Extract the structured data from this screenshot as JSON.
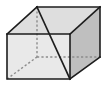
{
  "figure": {
    "shape_name": "cuboid",
    "width_px": 108,
    "height_px": 92,
    "background_color": "#ffffff"
  },
  "colors": {
    "front_face": "#e9e9e9",
    "top_face": "#dedede",
    "right_face": "#bfbfbf",
    "edge_stroke": "#1d1d1d",
    "hidden_stroke": "#8c8c8c",
    "diagonal_stroke": "#1d1d1d",
    "background": "#ffffff"
  },
  "strokes": {
    "edge_width": 1.6,
    "hidden_width": 1.4,
    "diagonal_width": 1.7,
    "hidden_dash": "2.2 2.2"
  },
  "vertices": {
    "front_top_left": [
      7,
      34
    ],
    "front_top_right": [
      70,
      34
    ],
    "front_bottom_right": [
      70,
      79
    ],
    "front_bottom_left": [
      7,
      79
    ],
    "back_top_left": [
      37,
      7
    ],
    "back_top_right": [
      100,
      7
    ],
    "back_bottom_right": [
      100,
      57
    ],
    "back_bottom_left": [
      37,
      57
    ]
  },
  "faces": {
    "front": "7,34 70,34 70,79 7,79",
    "top": "7,34 37,7 100,7 70,34",
    "right": "70,34 100,7 100,57 70,79"
  },
  "edges": {
    "front_rect": "7,34 70,34 70,79 7,79 7,34",
    "top_left_slant": "7,34 37,7",
    "top_back_edge": "37,7 100,7",
    "top_right_slant": "70,34 100,7",
    "right_back_vertical": "100,7 100,57",
    "right_bottom_slant": "70,79 100,57"
  },
  "hidden_edges": {
    "back_left_vertical": "37,7 37,57",
    "back_bottom_left_slant": "7,79 37,57",
    "back_bottom_edge": "37,57 100,57"
  },
  "diagonal": {
    "label": "space-diagonal",
    "path": "37,7 70,79",
    "from_vertex": "back_top_left",
    "to_vertex": "front_bottom_right"
  }
}
